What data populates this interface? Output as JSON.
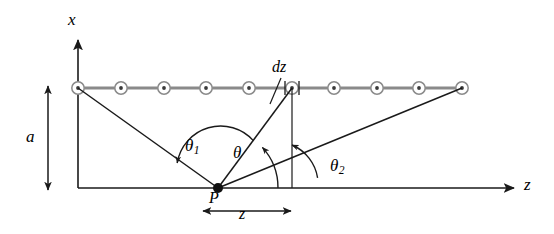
{
  "figure": {
    "colors": {
      "line": "#1a1a1a",
      "wire": "#8a8a8a",
      "marker_stroke": "#8a8a8a",
      "marker_fill": "#ffffff",
      "marker_dot": "#3a3a3a",
      "background": "#ffffff"
    },
    "axes": {
      "vertical_label": "x",
      "horizontal_label": "z",
      "origin": {
        "x": 78,
        "y": 188
      }
    },
    "labels": {
      "distance_a": "a",
      "element_dz": "dz",
      "point_P": "P",
      "distance_z": "z",
      "theta_1": "θ",
      "theta_1_sub": "1",
      "theta": "θ",
      "theta_2": "θ",
      "theta_2_sub": "2"
    },
    "wire": {
      "y": 88,
      "x_start": 78,
      "x_end": 462,
      "marker_count": 10,
      "marker_positions": [
        78,
        121,
        164,
        206,
        249,
        292,
        334,
        377,
        419,
        462
      ],
      "marker_symbol": "current-out-of-page-dot"
    },
    "element": {
      "tick_left_x": 285,
      "tick_right_x": 299,
      "center_x": 292
    },
    "point_P": {
      "x": 218,
      "y": 188
    },
    "rays": [
      {
        "name": "ray-to-near-end",
        "from": [
          218,
          188
        ],
        "to": [
          78,
          88
        ]
      },
      {
        "name": "ray-to-element",
        "from": [
          218,
          188
        ],
        "to": [
          292,
          88
        ]
      },
      {
        "name": "ray-to-far-end",
        "from": [
          218,
          188
        ],
        "to": [
          462,
          88
        ]
      }
    ],
    "dimension_a": {
      "x": 48,
      "y_top": 86,
      "y_bottom": 190
    },
    "dimension_z": {
      "y": 211,
      "x_left": 203,
      "x_right": 291
    }
  }
}
